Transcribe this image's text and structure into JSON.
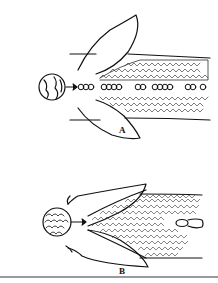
{
  "figure": {
    "panels": [
      {
        "id": "A",
        "label": "A",
        "description": "Line drawing: elongated body with two lobes, circular inset with arrow pointing to a single row of rounded segments running along the midline, flanked by textured fields"
      },
      {
        "id": "B",
        "label": "B",
        "description": "Line drawing: elongated body with two lobes, circular inset showing scale-like pattern with arrow pointing to a wedge-shaped densely textured field covering most of the body, small oval structure near the right end"
      }
    ]
  },
  "colors": {
    "ink": "#111111",
    "background": "#ffffff",
    "rule": "#9a9a9a"
  }
}
